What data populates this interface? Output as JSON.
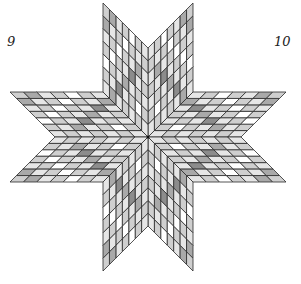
{
  "figure": {
    "type": "lone-star-quilt",
    "labels": {
      "left": "9",
      "right": "10"
    },
    "center": [
      148,
      137
    ],
    "arm_vertices_upper_right": {
      "center": [
        148,
        137
      ],
      "a": [
        193,
        92
      ],
      "tip": [
        193,
        3
      ],
      "b": [
        148,
        48
      ]
    },
    "grid": 7,
    "arm_count": 8,
    "colors": {
      "stroke": "#2a2a2a",
      "shades": [
        "#ffffff",
        "#e6e6e6",
        "#cfcfcf",
        "#a9a9a9",
        "#8c8c8c"
      ]
    },
    "shade_pattern": [
      [
        1,
        2,
        1,
        2,
        1,
        2,
        1
      ],
      [
        2,
        0,
        2,
        1,
        3,
        1,
        2
      ],
      [
        1,
        2,
        1,
        4,
        1,
        2,
        0
      ],
      [
        2,
        1,
        3,
        1,
        2,
        0,
        2
      ],
      [
        1,
        4,
        1,
        2,
        0,
        2,
        1
      ],
      [
        3,
        1,
        2,
        0,
        2,
        1,
        3
      ],
      [
        1,
        2,
        0,
        2,
        1,
        3,
        2
      ]
    ]
  }
}
